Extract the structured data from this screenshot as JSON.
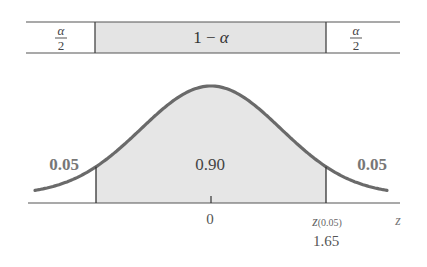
{
  "band": {
    "left_numerator": "α",
    "left_denominator": "2",
    "middle_text_prefix": "1 − ",
    "middle_text_symbol": "α",
    "right_numerator": "α",
    "right_denominator": "2"
  },
  "areas": {
    "left_tail": "0.05",
    "center": "0.90",
    "right_tail": "0.05"
  },
  "axis": {
    "zero_label": "0",
    "critical_symbol": "z",
    "critical_subscript": "(0.05)",
    "critical_value": "1.65",
    "axis_label": "z"
  },
  "colors": {
    "curve": "#6a6a6a",
    "shade": "#e6e6e6",
    "lines": "#444444"
  },
  "chart_data": {
    "type": "area",
    "title": "",
    "distribution": "standard normal",
    "shaded_region": {
      "from": -1.65,
      "to": 1.65,
      "area": 0.9
    },
    "tails": [
      {
        "side": "left",
        "area": 0.05
      },
      {
        "side": "right",
        "area": 0.05
      }
    ],
    "top_band": [
      "α/2",
      "1 − α",
      "α/2"
    ],
    "x_ticks": [
      {
        "value": 0,
        "label": "0"
      },
      {
        "value": 1.65,
        "label": "z(0.05) 1.65"
      }
    ],
    "xlabel": "z"
  }
}
